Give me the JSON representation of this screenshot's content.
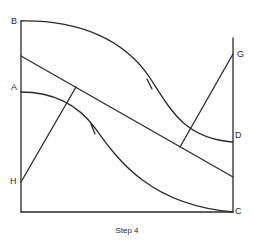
{
  "diagram": {
    "caption": "Step 4",
    "stroke_color": "#2a2a2a",
    "points": {
      "A": "A",
      "B": "B",
      "C": "C",
      "D": "D",
      "G": "G",
      "H": "H"
    }
  }
}
